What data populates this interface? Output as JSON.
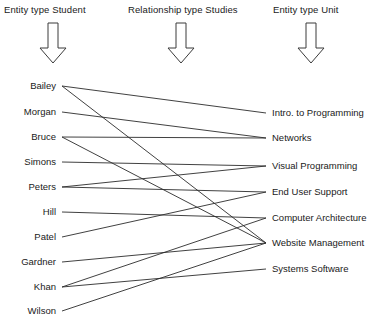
{
  "headers": [
    {
      "id": "student",
      "text": "Entity type Student"
    },
    {
      "id": "studies",
      "text": "Relationship type Studies"
    },
    {
      "id": "unit",
      "text": "Entity type Unit"
    }
  ],
  "arrows": [
    {
      "id": "arrow-student",
      "name": "down-arrow-icon"
    },
    {
      "id": "arrow-studies",
      "name": "down-arrow-icon"
    },
    {
      "id": "arrow-unit",
      "name": "down-arrow-icon"
    }
  ],
  "students": [
    {
      "id": "bailey",
      "label": "Bailey",
      "x": 62,
      "y": 86
    },
    {
      "id": "morgan",
      "label": "Morgan",
      "x": 62,
      "y": 112
    },
    {
      "id": "bruce",
      "label": "Bruce",
      "x": 62,
      "y": 137
    },
    {
      "id": "simons",
      "label": "Simons",
      "x": 62,
      "y": 162
    },
    {
      "id": "peters",
      "label": "Peters",
      "x": 62,
      "y": 187
    },
    {
      "id": "hill",
      "label": "Hill",
      "x": 62,
      "y": 212
    },
    {
      "id": "patel",
      "label": "Patel",
      "x": 62,
      "y": 237
    },
    {
      "id": "gardner",
      "label": "Gardner",
      "x": 62,
      "y": 262
    },
    {
      "id": "khan",
      "label": "Khan",
      "x": 62,
      "y": 287
    },
    {
      "id": "wilson",
      "label": "Wilson",
      "x": 62,
      "y": 311
    }
  ],
  "units": [
    {
      "id": "intro",
      "label": "Intro. to Programming",
      "x": 266,
      "y": 113
    },
    {
      "id": "networks",
      "label": "Networks",
      "x": 266,
      "y": 138
    },
    {
      "id": "visualprog",
      "label": "Visual Programming",
      "x": 266,
      "y": 166
    },
    {
      "id": "enduser",
      "label": "End User Support",
      "x": 266,
      "y": 192
    },
    {
      "id": "comparch",
      "label": "Computer Architecture",
      "x": 266,
      "y": 218
    },
    {
      "id": "website",
      "label": "Website Management",
      "x": 266,
      "y": 243
    },
    {
      "id": "syssoftware",
      "label": "Systems Software",
      "x": 266,
      "y": 269
    }
  ],
  "edges": [
    {
      "from": "bailey",
      "to": "intro"
    },
    {
      "from": "bailey",
      "to": "website"
    },
    {
      "from": "morgan",
      "to": "networks"
    },
    {
      "from": "bruce",
      "to": "networks"
    },
    {
      "from": "bruce",
      "to": "website"
    },
    {
      "from": "simons",
      "to": "visualprog"
    },
    {
      "from": "peters",
      "to": "visualprog"
    },
    {
      "from": "peters",
      "to": "enduser"
    },
    {
      "from": "hill",
      "to": "comparch"
    },
    {
      "from": "patel",
      "to": "enduser"
    },
    {
      "from": "gardner",
      "to": "website"
    },
    {
      "from": "khan",
      "to": "comparch"
    },
    {
      "from": "khan",
      "to": "syssoftware"
    },
    {
      "from": "wilson",
      "to": "website"
    }
  ],
  "style": {
    "line_color": "#2b2b2b",
    "text_color": "#1a1a1a",
    "background": "#ffffff"
  }
}
